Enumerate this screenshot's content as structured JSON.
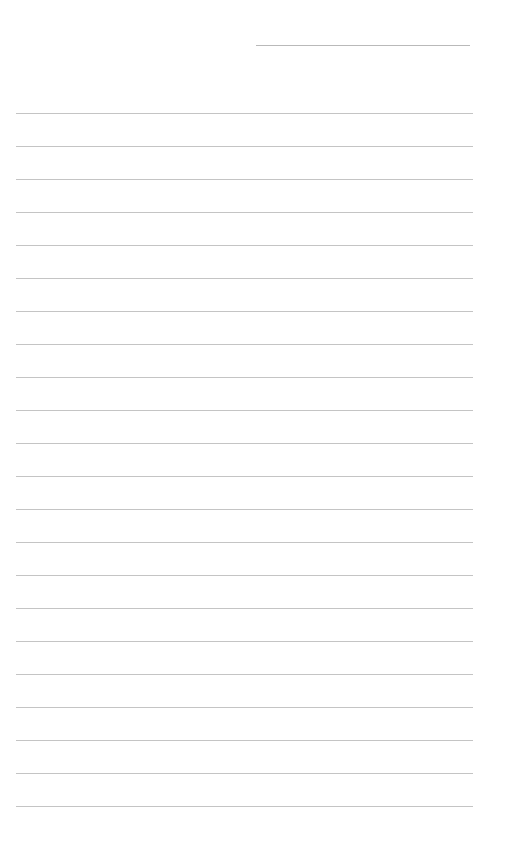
{
  "page": {
    "type": "lined-paper",
    "background_color": "#ffffff",
    "line_color": "#c4c4c4",
    "header_line": {
      "present": true
    },
    "ruled_lines": {
      "count": 22,
      "first_y": 113,
      "spacing": 33
    }
  }
}
